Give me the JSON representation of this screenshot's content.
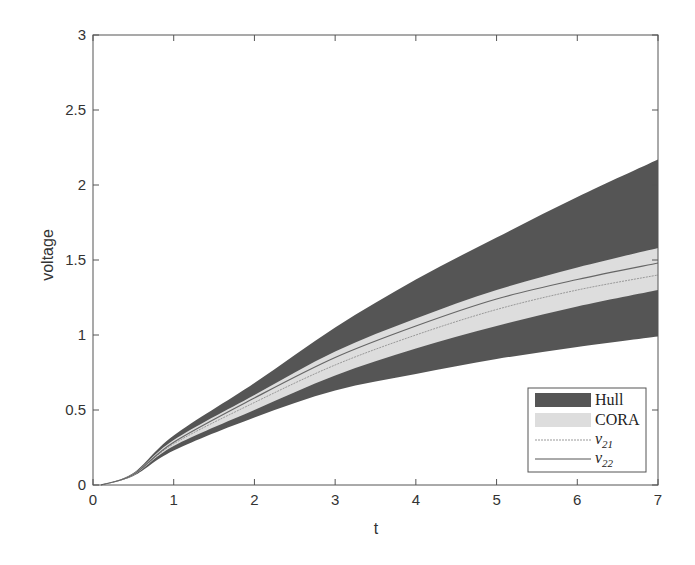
{
  "chart_data": {
    "type": "area",
    "title": "",
    "xlabel": "t",
    "ylabel": "voltage",
    "xlim": [
      0,
      7
    ],
    "ylim": [
      0,
      3
    ],
    "xticks": [
      0,
      1,
      2,
      3,
      4,
      5,
      6,
      7
    ],
    "xtick_labels": [
      "0",
      "1",
      "2",
      "3",
      "4",
      "5",
      "6",
      "7"
    ],
    "yticks": [
      0,
      0.5,
      1,
      1.5,
      2,
      2.5,
      3
    ],
    "ytick_labels": [
      "0",
      "0.5",
      "1",
      "1.5",
      "2",
      "2.5",
      "3"
    ],
    "grid": false,
    "legend_position": "lower right",
    "x": [
      0.1,
      0.5,
      1,
      2,
      3,
      4,
      5,
      6,
      7
    ],
    "series": [
      {
        "name": "Hull",
        "kind": "band",
        "color": "#555555",
        "upper": [
          0,
          0.08,
          0.33,
          0.68,
          1.05,
          1.37,
          1.65,
          1.92,
          2.17
        ],
        "lower": [
          0,
          0.06,
          0.23,
          0.45,
          0.63,
          0.74,
          0.84,
          0.92,
          0.99
        ]
      },
      {
        "name": "CORA",
        "kind": "band",
        "color": "#dddddd",
        "upper": [
          0,
          0.075,
          0.3,
          0.6,
          0.89,
          1.11,
          1.3,
          1.45,
          1.58
        ],
        "lower": [
          0,
          0.065,
          0.26,
          0.5,
          0.73,
          0.91,
          1.06,
          1.19,
          1.3
        ]
      },
      {
        "name": "v21",
        "kind": "line",
        "color": "#999999",
        "style": "dotted",
        "values": [
          0,
          0.068,
          0.275,
          0.55,
          0.8,
          1.0,
          1.17,
          1.3,
          1.4
        ]
      },
      {
        "name": "v22",
        "kind": "line",
        "color": "#666666",
        "style": "solid",
        "values": [
          0,
          0.07,
          0.285,
          0.58,
          0.85,
          1.06,
          1.24,
          1.37,
          1.48
        ]
      }
    ]
  },
  "legend": {
    "items": [
      {
        "label": "Hull",
        "sub": ""
      },
      {
        "label": "CORA",
        "sub": ""
      },
      {
        "label": "v",
        "sub": "21"
      },
      {
        "label": "v",
        "sub": "22"
      }
    ]
  },
  "axes": {
    "xlabel": "t",
    "ylabel": "voltage"
  }
}
